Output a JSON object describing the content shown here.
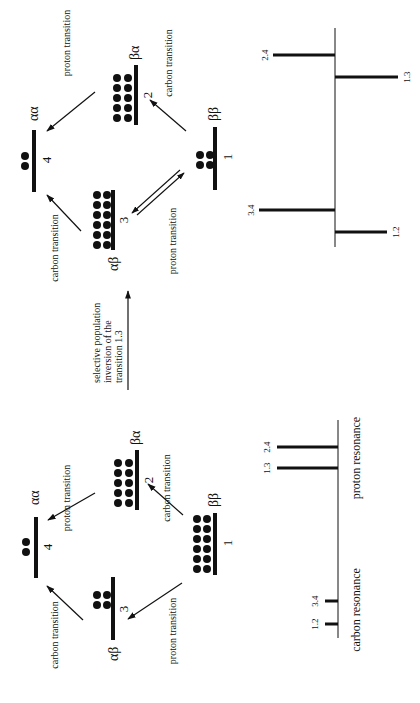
{
  "figure": {
    "orientation": "rotated-90-ccw",
    "left_diagram": {
      "levels": [
        {
          "id": "1",
          "state": "ββ",
          "population": 12
        },
        {
          "id": "2",
          "state": "βα",
          "population": 10
        },
        {
          "id": "3",
          "state": "αβ",
          "population": 4
        },
        {
          "id": "4",
          "state": "αα",
          "population": 2
        }
      ],
      "transitions": [
        {
          "label": "proton transition",
          "from": "2",
          "to": "4"
        },
        {
          "label": "carbon transition",
          "from": "1",
          "to": "2"
        },
        {
          "label": "carbon transition",
          "from": "3",
          "to": "4"
        },
        {
          "label": "proton transition",
          "from": "1",
          "to": "3"
        }
      ]
    },
    "middle": {
      "line1": "selective population",
      "line2": "inversion of the",
      "line3": "transition 1.3"
    },
    "right_diagram": {
      "levels": [
        {
          "id": "1",
          "state": "ββ",
          "population": 4
        },
        {
          "id": "2",
          "state": "βα",
          "population": 10
        },
        {
          "id": "3",
          "state": "αβ",
          "population": 12
        },
        {
          "id": "4",
          "state": "αα",
          "population": 2
        }
      ],
      "transitions": [
        {
          "label": "proton transition",
          "from": "2",
          "to": "4"
        },
        {
          "label": "carbon transition",
          "from": "1",
          "to": "2"
        },
        {
          "label": "carbon transition",
          "from": "3",
          "to": "4"
        },
        {
          "label": "proton transition",
          "from": "1",
          "to": "3"
        }
      ]
    },
    "left_spectrum": {
      "peaks": [
        {
          "label": "1.2",
          "intensity": 1,
          "direction": "up"
        },
        {
          "label": "3.4",
          "intensity": 1,
          "direction": "up"
        },
        {
          "label": "1.3",
          "intensity": 4,
          "direction": "up"
        },
        {
          "label": "2.4",
          "intensity": 4,
          "direction": "up"
        }
      ],
      "carbon_label": "carbon resonance",
      "proton_label": "proton resonance"
    },
    "right_spectrum": {
      "peaks": [
        {
          "label": "1.2",
          "intensity": -3,
          "direction": "down"
        },
        {
          "label": "3.4",
          "intensity": 5,
          "direction": "up"
        },
        {
          "label": "1.3",
          "intensity": -4,
          "direction": "down"
        },
        {
          "label": "2.4",
          "intensity": 4,
          "direction": "up"
        }
      ]
    }
  }
}
